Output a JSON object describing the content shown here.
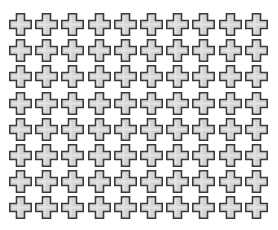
{
  "pattern": {
    "shape": "plus-cross",
    "rows": 8,
    "columns": 10,
    "pitch_x": 26.2,
    "pitch_y": 26.2,
    "size": 23,
    "colors": {
      "outline": "#3a3a3a",
      "fill": "#d4d4d4",
      "highlight": "#ececec",
      "background": "#ffffff"
    }
  }
}
